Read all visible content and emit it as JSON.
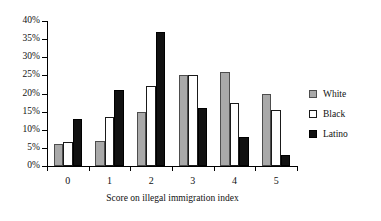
{
  "chart_data": {
    "type": "bar",
    "title": "",
    "xlabel": "Score on illegal immigration index",
    "ylabel": "",
    "categories": [
      "0",
      "1",
      "2",
      "3",
      "4",
      "5"
    ],
    "series": [
      {
        "name": "White",
        "values": [
          6,
          7,
          15,
          25,
          26,
          20
        ],
        "color": "#a9a9a9"
      },
      {
        "name": "Black",
        "values": [
          6.5,
          13.5,
          22,
          25,
          17.5,
          15.5
        ],
        "color": "#ffffff"
      },
      {
        "name": "Latino",
        "values": [
          13,
          21,
          37,
          16,
          8,
          3
        ],
        "color": "#111111"
      }
    ],
    "ylim": [
      0,
      40
    ],
    "ytick_values": [
      0,
      5,
      10,
      15,
      20,
      25,
      30,
      35,
      40
    ],
    "ytick_labels": [
      "0%",
      "5%",
      "10%",
      "15%",
      "20%",
      "25%",
      "30%",
      "35%",
      "40%"
    ],
    "grid": false,
    "legend_position": "right",
    "value_suffix": "%"
  }
}
